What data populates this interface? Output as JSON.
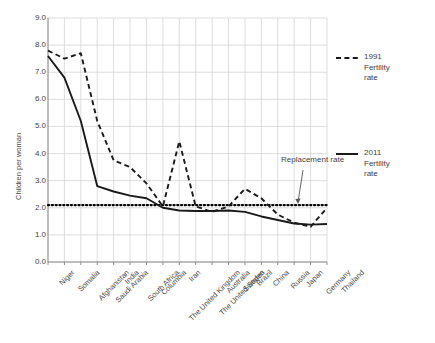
{
  "chart_data": {
    "type": "line",
    "title": "",
    "xlabel": "",
    "ylabel": "Children per woman",
    "ylim": [
      0.0,
      9.0
    ],
    "ytick_step": 1.0,
    "ytick_labels": [
      "0.0",
      "1.0",
      "2.0",
      "3.0",
      "4.0",
      "5.0",
      "6.0",
      "7.0",
      "8.0",
      "9.0"
    ],
    "grid": true,
    "legend_position": "right",
    "categories": [
      "Niger",
      "Somalia",
      "Afghanistan",
      "Saudi Arabia",
      "India",
      "South Africa",
      "Columbia",
      "The United Kingdom",
      "Iran",
      "The United States",
      "Australia",
      "Sweden",
      "Brazil",
      "China",
      "Russia",
      "Japan",
      "Germany",
      "Thailand"
    ],
    "series": [
      {
        "name": "1991 Fertility rate",
        "style": "dashed",
        "color": "#1a1a1a",
        "values": [
          7.8,
          7.5,
          7.7,
          5.2,
          3.75,
          3.5,
          2.9,
          2.05,
          4.45,
          2.05,
          1.85,
          2.05,
          2.7,
          2.35,
          1.75,
          1.45,
          1.3,
          2.0
        ]
      },
      {
        "name": "2011 Fertility rate",
        "style": "solid",
        "color": "#1a1a1a",
        "values": [
          7.6,
          6.8,
          5.2,
          2.8,
          2.6,
          2.45,
          2.35,
          2.0,
          1.9,
          1.88,
          1.88,
          1.9,
          1.85,
          1.68,
          1.55,
          1.42,
          1.38,
          1.4
        ]
      }
    ],
    "reference_line": {
      "label": "Replacement rate",
      "value": 2.1,
      "style": "dotted",
      "color": "#000000"
    }
  },
  "legend": [
    {
      "label_line1": "1991",
      "label_line2": "Fertility",
      "label_line3": "rate",
      "style": "dashed"
    },
    {
      "label_line1": "2011",
      "label_line2": "Fertility",
      "label_line3": "rate",
      "style": "solid"
    }
  ],
  "annotation": {
    "replacement_rate": "Replacement rate"
  },
  "colors": {
    "background": "#ffffff",
    "grid": "#d4d4d4",
    "axis": "#8c8c8c",
    "line": "#1a1a1a",
    "text": "#3f3f3f"
  }
}
